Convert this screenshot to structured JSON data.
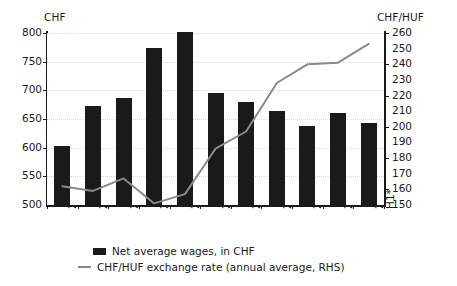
{
  "chart_data": {
    "type": "bar",
    "title": "",
    "xlabel": "",
    "ylabel": "CHF",
    "y2label": "CHF/HUF",
    "ylim": [
      500,
      800
    ],
    "y2lim": [
      150,
      260
    ],
    "yticks": [
      500,
      550,
      600,
      650,
      700,
      750,
      800
    ],
    "y2ticks": [
      150,
      160,
      170,
      180,
      190,
      200,
      210,
      220,
      230,
      240,
      250,
      260
    ],
    "grid": true,
    "legend_position": "bottom",
    "categories": [
      "2004",
      "2005",
      "2006",
      "2007",
      "2008",
      "2009",
      "2010",
      "2011",
      "2012",
      "2013",
      "2014 H1*"
    ],
    "category_lines": [
      [
        "2004"
      ],
      [
        "2005"
      ],
      [
        "2006"
      ],
      [
        "2007"
      ],
      [
        "2008"
      ],
      [
        "2009"
      ],
      [
        "2010"
      ],
      [
        "2011"
      ],
      [
        "2012"
      ],
      [
        "2013"
      ],
      [
        "2014",
        "H1*"
      ]
    ],
    "series": [
      {
        "name": "Net average wages, in CHF",
        "type": "bar",
        "axis": "left",
        "color": "#1a1a1a",
        "values": [
          603,
          672,
          687,
          774,
          801,
          696,
          680,
          664,
          638,
          661,
          643
        ]
      },
      {
        "name": "CHF/HUF exchange rate (annual average, RHS)",
        "type": "line",
        "axis": "right",
        "color": "#8a8a8a",
        "values": [
          162,
          159,
          167,
          151,
          157,
          186,
          197,
          228,
          240,
          241,
          253
        ]
      }
    ]
  },
  "axes": {
    "left_title": "CHF",
    "right_title": "CHF/HUF"
  },
  "legend": {
    "items": [
      {
        "label": "Net average wages, in CHF",
        "marker": "bar-swatch",
        "color": "#1a1a1a"
      },
      {
        "label": "CHF/HUF exchange rate (annual average, RHS)",
        "marker": "line-swatch",
        "color": "#8a8a8a"
      }
    ]
  }
}
